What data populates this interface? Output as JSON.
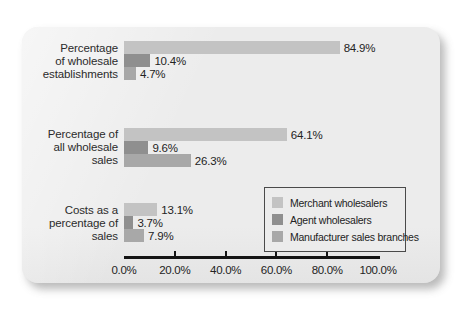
{
  "chart_data": {
    "type": "bar",
    "orientation": "horizontal",
    "title": "",
    "subtitle": "",
    "xlabel": "",
    "ylabel": "",
    "xlim": [
      0,
      100
    ],
    "xtick_labels": [
      "0.0%",
      "20.0%",
      "40.0%",
      "60.0%",
      "80.0%",
      "100.0%"
    ],
    "xtick_values": [
      0,
      20,
      40,
      60,
      80,
      100
    ],
    "grid": false,
    "legend_position": "inside-bottom-right",
    "categories": [
      "Percentage\nof wholesale\nestablishments",
      "Percentage of\nall wholesale\nsales",
      "Costs as a\npercentage of\nsales"
    ],
    "series": [
      {
        "name": "Merchant wholesalers",
        "color": "#c3c3c3",
        "values": [
          84.9,
          64.1,
          13.1
        ],
        "labels": [
          "84.9%",
          "64.1%",
          "13.1%"
        ]
      },
      {
        "name": "Agent wholesalers",
        "color": "#8f8f8f",
        "values": [
          10.4,
          9.6,
          3.7
        ],
        "labels": [
          "10.4%",
          "9.6%",
          "3.7%"
        ]
      },
      {
        "name": "Manufacturer sales branches",
        "color": "#a8a8a8",
        "values": [
          4.7,
          26.3,
          7.9
        ],
        "labels": [
          "4.7%",
          "26.3%",
          "7.9%"
        ]
      }
    ]
  },
  "legend": {
    "items": [
      {
        "label": "Merchant wholesalers",
        "color": "#c3c3c3"
      },
      {
        "label": "Agent wholesalers",
        "color": "#8f8f8f"
      },
      {
        "label": "Manufacturer sales branches",
        "color": "#a8a8a8"
      }
    ]
  },
  "axis": {
    "ticks": [
      {
        "label": "0.0%",
        "value": 0
      },
      {
        "label": "20.0%",
        "value": 20
      },
      {
        "label": "40.0%",
        "value": 40
      },
      {
        "label": "60.0%",
        "value": 60
      },
      {
        "label": "80.0%",
        "value": 80
      },
      {
        "label": "100.0%",
        "value": 100
      }
    ]
  },
  "groups": [
    {
      "label": "Percentage\nof wholesale\nestablishments"
    },
    {
      "label": "Percentage of\nall wholesale\nsales"
    },
    {
      "label": "Costs as a\npercentage of\nsales"
    }
  ]
}
